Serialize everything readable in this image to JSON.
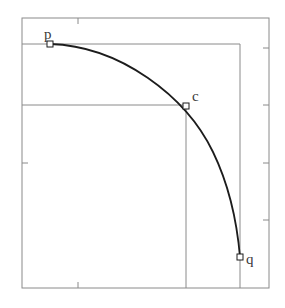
{
  "figure": {
    "title": "",
    "background_color": "#ffffff",
    "frame": {
      "x0": 22,
      "y0": 18,
      "x1": 269,
      "y1": 288,
      "stroke": "#8a8a8a",
      "stroke_width": 1,
      "ticks": {
        "length": 6,
        "top": [
          78
        ],
        "bottom": [
          78
        ],
        "left": [
          163
        ],
        "right": [
          48,
          105,
          163,
          220
        ]
      }
    },
    "guides": [
      {
        "name": "guide-horizontal-p",
        "x1": 22,
        "y1": 44,
        "x2": 240,
        "y2": 44
      },
      {
        "name": "guide-vertical-q",
        "x1": 240,
        "y1": 44,
        "x2": 240,
        "y2": 288
      },
      {
        "name": "guide-horizontal-c",
        "x1": 22,
        "y1": 105,
        "x2": 186,
        "y2": 105
      },
      {
        "name": "guide-vertical-c",
        "x1": 186,
        "y1": 105,
        "x2": 186,
        "y2": 288
      }
    ],
    "guide_stroke": "#8a8a8a",
    "curve": {
      "name": "bezier-arc",
      "stroke": "#1c1c1c",
      "stroke_width": 1.8,
      "path": "M 50 44 C 120 46 186 96 213 152 C 228 183 237 222 240 257"
    },
    "points": [
      {
        "id": "p",
        "label": "p",
        "x": 50,
        "y": 44,
        "label_x": 44,
        "label_y": 27
      },
      {
        "id": "c",
        "label": "c",
        "x": 186,
        "y": 106,
        "label_x": 192,
        "label_y": 89
      },
      {
        "id": "q",
        "label": "q",
        "x": 240,
        "y": 257,
        "label_x": 246,
        "label_y": 252
      }
    ],
    "marker": {
      "shape": "open-square",
      "size": 6,
      "stroke": "#1c1c1c",
      "fill": "#ffffff"
    }
  }
}
